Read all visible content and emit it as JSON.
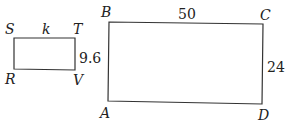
{
  "diagram": {
    "small_rect": {
      "vertices": {
        "top_left": "S",
        "top_right": "T",
        "bottom_left": "R",
        "bottom_right": "V"
      },
      "top_side_label": "k",
      "right_side_label": "9.6"
    },
    "large_rect": {
      "vertices": {
        "top_left": "B",
        "top_right": "C",
        "bottom_left": "A",
        "bottom_right": "D"
      },
      "top_side_label": "50",
      "right_side_label": "24"
    },
    "colors": {
      "stroke": "#333333",
      "text": "#222222"
    }
  }
}
